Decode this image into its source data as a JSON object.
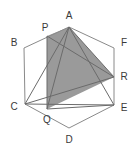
{
  "figure": {
    "canvas": {
      "width": 137,
      "height": 155
    },
    "colors": {
      "background": "#ffffff",
      "stroke": "#8a8a8a",
      "stroke_dark": "#6b6b6b",
      "shaded_fill": "#9a9a9a",
      "label_color": "#3a3a3a"
    },
    "points": {
      "A": {
        "label": "A",
        "x": 69,
        "y": 27,
        "label_x": 69,
        "label_y": 16
      },
      "B": {
        "label": "B",
        "x": 24,
        "y": 48,
        "label_x": 14,
        "label_y": 43
      },
      "C": {
        "label": "C",
        "x": 25,
        "y": 104,
        "label_x": 14,
        "label_y": 107
      },
      "D": {
        "label": "D",
        "x": 69,
        "y": 128,
        "label_x": 69,
        "label_y": 140
      },
      "E": {
        "label": "E",
        "x": 114,
        "y": 105,
        "label_x": 124,
        "label_y": 108
      },
      "F": {
        "label": "F",
        "x": 114,
        "y": 48,
        "label_x": 124,
        "label_y": 43
      },
      "P": {
        "label": "P",
        "x": 47,
        "y": 36,
        "label_x": 45,
        "label_y": 28
      },
      "Q": {
        "label": "Q",
        "x": 47,
        "y": 109,
        "label_x": 47,
        "label_y": 120
      },
      "R": {
        "label": "R",
        "x": 114,
        "y": 77,
        "label_x": 124,
        "label_y": 77
      }
    },
    "hexagon": {
      "name": "hexagon-ABCDEF",
      "order": [
        "A",
        "B",
        "C",
        "D",
        "E",
        "F"
      ]
    },
    "shaded_polygon": {
      "name": "shaded-quadrilateral",
      "order": [
        "P",
        "A",
        "R",
        "Q"
      ],
      "fill": "#9a9a9a"
    },
    "segments": [
      {
        "name": "segment-A-C",
        "from": "A",
        "to": "C"
      },
      {
        "name": "segment-A-E",
        "from": "A",
        "to": "E"
      },
      {
        "name": "segment-A-Q",
        "from": "A",
        "to": "Q"
      },
      {
        "name": "segment-A-R",
        "from": "A",
        "to": "R"
      },
      {
        "name": "segment-P-Q",
        "from": "P",
        "to": "Q"
      },
      {
        "name": "segment-C-R",
        "from": "C",
        "to": "R"
      },
      {
        "name": "segment-C-E",
        "from": "C",
        "to": "E"
      },
      {
        "name": "segment-Q-E",
        "from": "Q",
        "to": "E"
      },
      {
        "name": "segment-P-R",
        "from": "P",
        "to": "R"
      }
    ]
  }
}
